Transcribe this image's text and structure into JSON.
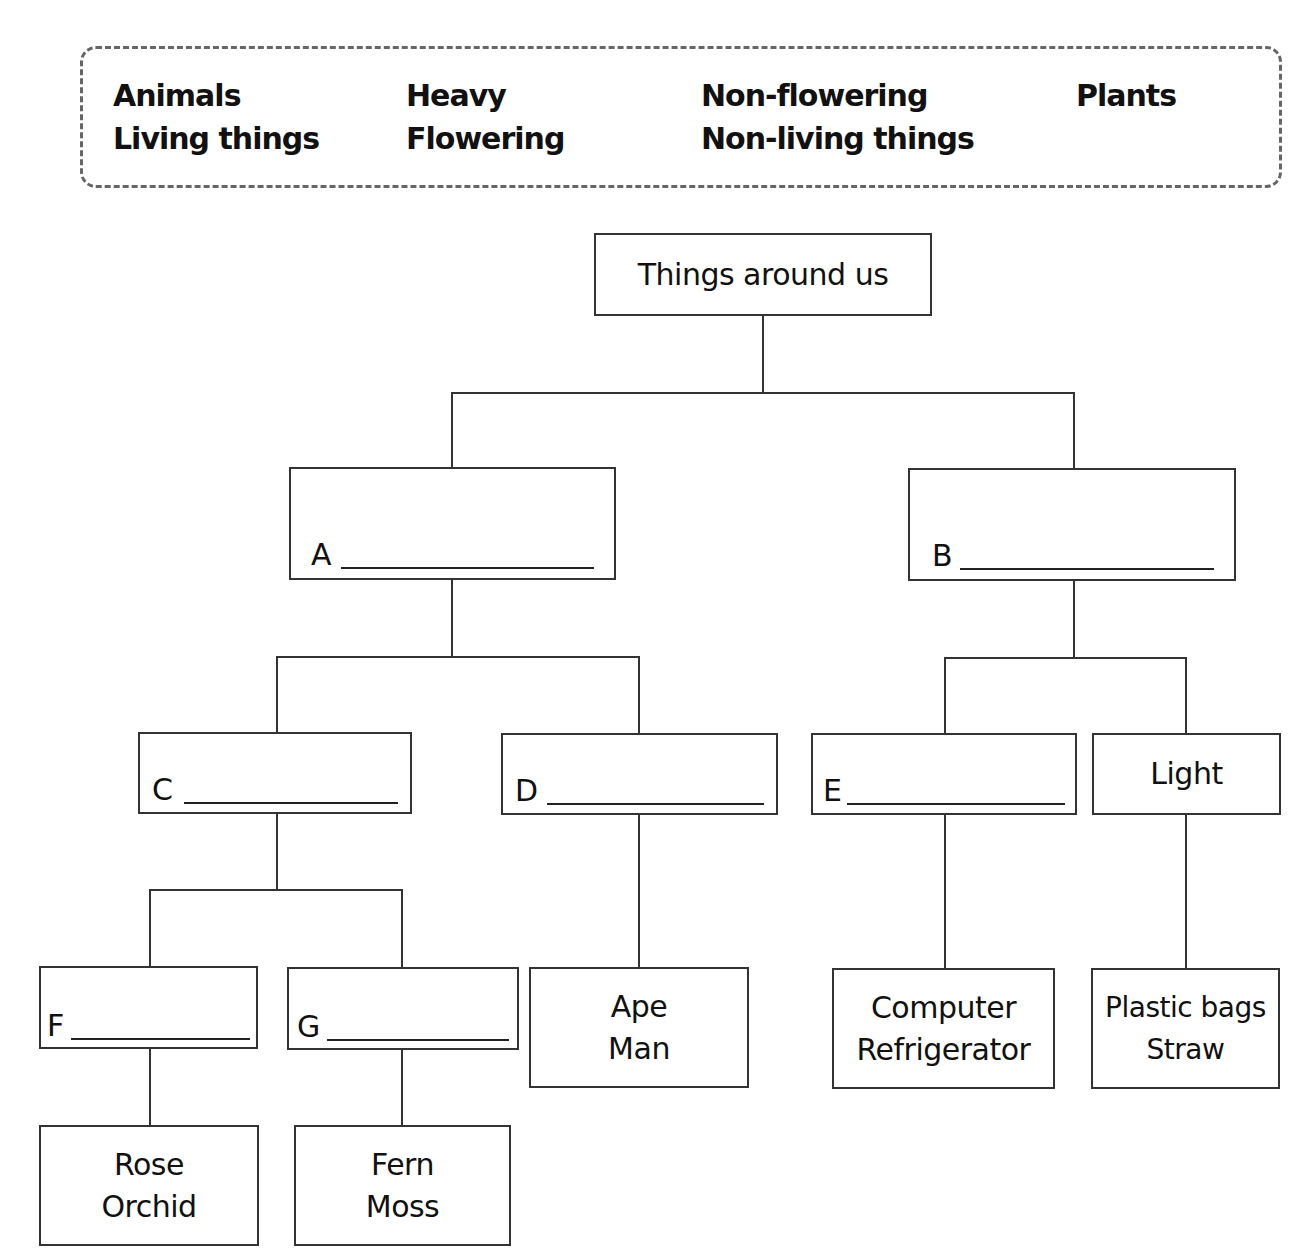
{
  "word_bank": {
    "words": [
      "Animals",
      "Heavy",
      "Non-flowering",
      "Plants",
      "Living things",
      "Flowering",
      "Non-living things"
    ]
  },
  "tree": {
    "root": {
      "text": "Things around us"
    },
    "nodes": {
      "A": {
        "letter": "A",
        "answer": ""
      },
      "B": {
        "letter": "B",
        "answer": ""
      },
      "C": {
        "letter": "C",
        "answer": ""
      },
      "D": {
        "letter": "D",
        "answer": ""
      },
      "E": {
        "letter": "E",
        "answer": ""
      },
      "F": {
        "letter": "F",
        "answer": ""
      },
      "G": {
        "letter": "G",
        "answer": ""
      }
    },
    "light": {
      "text": "Light"
    },
    "leaves": {
      "ape_man": {
        "line1": "Ape",
        "line2": "Man"
      },
      "computer": {
        "line1": "Computer",
        "line2": "Refrigerator"
      },
      "plastic": {
        "line1": "Plastic bags",
        "line2": "Straw"
      },
      "rose": {
        "line1": "Rose",
        "line2": "Orchid"
      },
      "fern": {
        "line1": "Fern",
        "line2": "Moss"
      }
    }
  }
}
